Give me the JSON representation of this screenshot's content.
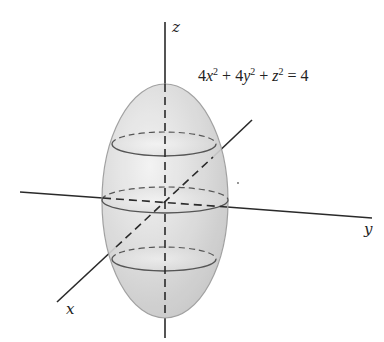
{
  "figure": {
    "equation": {
      "c1": "4",
      "v1": "x",
      "e1": "2",
      "op1": " + 4",
      "v2": "y",
      "e2": "2",
      "op2": " + ",
      "v3": "z",
      "e3": "2",
      "rhs": " = 4"
    },
    "axes": {
      "x_label": "x",
      "y_label": "y",
      "z_label": "z"
    },
    "surface": {
      "type": "ellipsoid",
      "fill_color": "#d4d4d4",
      "edge_color": "#9a9a9a",
      "cross_sections": [
        "upper",
        "middle",
        "lower"
      ]
    },
    "colors": {
      "axis": "#2a2a2a",
      "trace": "#555555"
    }
  }
}
